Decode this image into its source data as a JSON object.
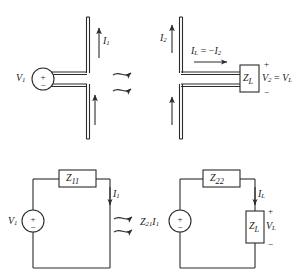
{
  "figure": {
    "stroke_color": "#2b2b2b",
    "fill_color": "#ffffff",
    "background": "#ffffff"
  },
  "top_left_antenna": {
    "source_label": "V",
    "source_sub": "1",
    "source_plus": "+",
    "source_minus": "−",
    "current_label": "I",
    "current_sub": "1",
    "upper_arm_arrow": "up",
    "lower_arm_arrow": "up"
  },
  "top_right_antenna": {
    "current_label": "I",
    "current_sub": "2",
    "load_label": "Z",
    "load_sub": "L",
    "load_current_label": "I",
    "load_current_sub": "L",
    "load_current_equals": " = −",
    "load_current_rhs": "I",
    "load_current_rhs_sub": "2",
    "voltage_label": "V",
    "voltage_sub": "2",
    "voltage_equals": " = ",
    "voltage_rhs": "V",
    "voltage_rhs_sub": "L",
    "plus": "+",
    "minus": "−"
  },
  "radiation": {
    "top_wave_count": 2,
    "bottom_wave_count": 2,
    "direction": "right"
  },
  "bottom_left_circuit": {
    "source_label": "V",
    "source_sub": "1",
    "source_plus": "+",
    "source_minus": "−",
    "impedance_label": "Z",
    "impedance_sub": "11",
    "current_label": "I",
    "current_sub": "1"
  },
  "bottom_right_circuit": {
    "source_label": "Z",
    "source_sub_a": "21",
    "source_label_b": "I",
    "source_sub_b": "1",
    "source_plus": "+",
    "source_minus": "−",
    "impedance_label": "Z",
    "impedance_sub": "22",
    "load_label": "Z",
    "load_sub": "L",
    "current_label": "I",
    "current_sub": "L",
    "voltage_label": "V",
    "voltage_sub": "L",
    "plus": "+",
    "minus": "−"
  }
}
